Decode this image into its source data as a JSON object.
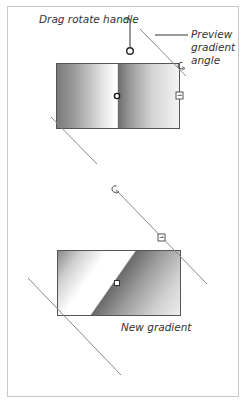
{
  "diagram": {
    "top_example": {
      "callouts": {
        "drag_rotate_handle": "Drag rotate handle",
        "preview_gradient_angle": "Preview gradient angle"
      },
      "handles": [
        "rotate-handle-circle",
        "center-handle",
        "rotate-cursor-icon",
        "resize-handle"
      ]
    },
    "bottom_example": {
      "caption": "New gradient",
      "handles": [
        "rotate-cursor-icon",
        "resize-handle",
        "center-handle"
      ]
    },
    "colors": {
      "frame_border": "#c8c8c8",
      "rect_border": "#555555",
      "guide_line": "#8a8a8a",
      "label_text": "#333333",
      "gradient_dark": "#6c6c6c",
      "gradient_light": "#ffffff"
    }
  }
}
